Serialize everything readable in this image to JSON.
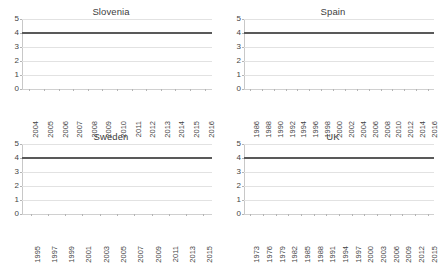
{
  "figure": {
    "panel_count": 4,
    "layout": "2x2"
  },
  "chart_data": [
    {
      "type": "line",
      "title": "Slovenia",
      "xlabel": "",
      "ylabel": "",
      "ylim": [
        0,
        5
      ],
      "yticks": [
        "5",
        "4",
        "3",
        "2",
        "1",
        "0"
      ],
      "grid": true,
      "legend": "none",
      "categories": [
        "2004",
        "2005",
        "2006",
        "2007",
        "2008",
        "2009",
        "2010",
        "2011",
        "2012",
        "2013",
        "2014",
        "2015",
        "2016"
      ],
      "values": [
        4,
        4,
        4,
        4,
        4,
        4,
        4,
        4,
        4,
        4,
        4,
        4,
        4
      ],
      "line_color": "#595959"
    },
    {
      "type": "line",
      "title": "Spain",
      "xlabel": "",
      "ylabel": "",
      "ylim": [
        0,
        5
      ],
      "yticks": [
        "5",
        "4",
        "3",
        "2",
        "1",
        "0"
      ],
      "grid": true,
      "legend": "none",
      "categories": [
        "1986",
        "1988",
        "1990",
        "1992",
        "1994",
        "1996",
        "1998",
        "2000",
        "2002",
        "2004",
        "2006",
        "2008",
        "2010",
        "2012",
        "2014",
        "2016"
      ],
      "values": [
        4,
        4,
        4,
        4,
        4,
        4,
        4,
        4,
        4,
        4,
        4,
        4,
        4,
        4,
        4,
        4
      ],
      "line_color": "#595959"
    },
    {
      "type": "line",
      "title": "Sweden",
      "xlabel": "",
      "ylabel": "",
      "ylim": [
        0,
        5
      ],
      "yticks": [
        "5",
        "4",
        "3",
        "2",
        "1",
        "0"
      ],
      "grid": true,
      "legend": "none",
      "categories": [
        "1995",
        "1997",
        "1999",
        "2001",
        "2003",
        "2005",
        "2007",
        "2009",
        "2011",
        "2013",
        "2015"
      ],
      "values": [
        4,
        4,
        4,
        4,
        4,
        4,
        4,
        4,
        4,
        4,
        4
      ],
      "line_color": "#595959"
    },
    {
      "type": "line",
      "title": "UK",
      "xlabel": "",
      "ylabel": "",
      "ylim": [
        0,
        5
      ],
      "yticks": [
        "5",
        "4",
        "3",
        "2",
        "1",
        "0"
      ],
      "grid": true,
      "legend": "none",
      "categories": [
        "1973",
        "1976",
        "1979",
        "1982",
        "1985",
        "1988",
        "1991",
        "1994",
        "1997",
        "2000",
        "2003",
        "2006",
        "2009",
        "2012",
        "2015"
      ],
      "values": [
        4,
        4,
        4,
        4,
        4,
        4,
        4,
        4,
        4,
        4,
        4,
        4,
        4,
        4,
        4
      ],
      "line_color": "#595959"
    }
  ]
}
